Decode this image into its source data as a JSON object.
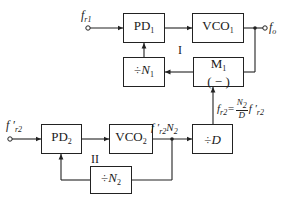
{
  "diagram": {
    "type": "block-diagram",
    "loop1": {
      "label": "I",
      "input": {
        "symbol": "f",
        "sub": "r1"
      },
      "output": {
        "symbol": "f",
        "sub": "o"
      },
      "blocks": {
        "pd1": {
          "text": "PD",
          "sub": "1"
        },
        "vco1": {
          "text": "VCO",
          "sub": "1"
        },
        "div_n1": {
          "text": "÷",
          "var": "N",
          "sub": "1"
        },
        "m1": {
          "text": "M",
          "sub": "1",
          "line2": "( − )"
        }
      }
    },
    "loop2": {
      "label": "II",
      "input": {
        "symbol": "f ′",
        "sub": "r2"
      },
      "vco_out_label": {
        "prefix": "f ′",
        "sub": "r2",
        "suffix": "N",
        "suffix_sub": "2"
      },
      "blocks": {
        "pd2": {
          "text": "PD",
          "sub": "2"
        },
        "vco2": {
          "text": "VCO",
          "sub": "2"
        },
        "div_n2": {
          "text": "÷",
          "var": "N",
          "sub": "2"
        },
        "div_d": {
          "text": "÷",
          "var": "D"
        }
      }
    },
    "mixer_input_label": {
      "lhs": "f",
      "lhs_sub": "r2",
      "eq": "=",
      "num": "N",
      "num_sub": "2",
      "den": "D",
      "rhs": "f ′",
      "rhs_sub": "r2"
    }
  }
}
